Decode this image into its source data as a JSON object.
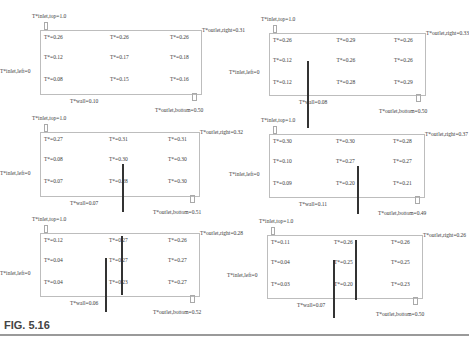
{
  "figure": {
    "caption": "FIG. 5.16"
  },
  "panels": [
    {
      "inlet": "T*inlet,top=1.0",
      "outlet_right": "T*outlet,right=0.31",
      "inlet_left": "T*inlet,left=0",
      "outlet_bottom": "T*outlet,bottom=0.50",
      "wall": "T*wall=0.10",
      "cells": [
        "T*=0.26",
        "T*=0.26",
        "T*=0.26",
        "T*=0.12",
        "T*=0.17",
        "T*=0.18",
        "T*=0.08",
        "T*=0.15",
        "T*=0.16"
      ],
      "partitions": []
    },
    {
      "inlet": "T*inlet,top=1.0",
      "outlet_right": "T*outlet,right=0.33",
      "inlet_left": "T*inlet,left=0",
      "outlet_bottom": "T*outlet,bottom=0.50",
      "wall": "T*wall=0.08",
      "cells": [
        "T*=0.26",
        "T*=0.29",
        "T*=0.26",
        "T*=0.12",
        "T*=0.26",
        "T*=0.26",
        "T*=0.12",
        "T*=0.28",
        "T*=0.29"
      ],
      "partitions": [
        {
          "x": 38,
          "top": 28,
          "bottom": 95
        }
      ]
    },
    {
      "inlet": "T*inlet,top=1.0",
      "outlet_right": "T*outlet,right=0.32",
      "inlet_left": "T*inlet,left=0",
      "outlet_bottom": "T*outlet,bottom=0.51",
      "wall": "T*wall=0.07",
      "cells": [
        "T*=0.27",
        "T*=0.31",
        "T*=0.31",
        "T*=0.08",
        "T*=0.30",
        "T*=0.30",
        "T*=0.07",
        "T*=0.28",
        "T*=0.30"
      ],
      "partitions": [
        {
          "x": 82,
          "top": 32,
          "bottom": 80
        }
      ]
    },
    {
      "inlet": "T*inlet,top=1.0",
      "outlet_right": "T*outlet,right=0.37",
      "inlet_left": "T*inlet,left=0",
      "outlet_bottom": "T*outlet,bottom=0.49",
      "wall": "T*wall=0.11",
      "cells": [
        "T*=0.30",
        "T*=0.30",
        "T*=0.28",
        "T*=0.10",
        "T*=0.27",
        "T*=0.27",
        "T*=0.09",
        "T*=0.20",
        "T*=0.21"
      ],
      "partitions": [
        {
          "x": 88,
          "top": 32,
          "bottom": 80
        }
      ]
    },
    {
      "inlet": "T*inlet,top=1.0",
      "outlet_right": "T*outlet,right=0.28",
      "inlet_left": "T*inlet,left=0",
      "outlet_bottom": "T*outlet,bottom=0.52",
      "wall": "T*wall=0.06",
      "cells": [
        "T*=0.12",
        "T*=0.27",
        "T*=0.26",
        "T*=0.04",
        "T*=0.27",
        "T*=0.27",
        "T*=0.04",
        "T*=0.23",
        "T*=0.27"
      ],
      "partitions": [
        {
          "x": 81,
          "top": 3,
          "bottom": 62
        },
        {
          "x": 65,
          "top": 25,
          "bottom": 79
        }
      ]
    },
    {
      "inlet": "T*inlet,top=1.0",
      "outlet_right": "T*outlet,right=0.26",
      "inlet_left": "T*inlet,left=0",
      "outlet_bottom": "T*outlet,bottom=0.50",
      "wall": "T*wall=0.07",
      "cells": [
        "T*=0.11",
        "T*=0.26",
        "T*=0.26",
        "T*=0.04",
        "T*=0.25",
        "T*=0.25",
        "T*=0.03",
        "T*=0.20",
        "T*=0.23"
      ],
      "partitions": [
        {
          "x": 88,
          "top": 5,
          "bottom": 65
        },
        {
          "x": 66,
          "top": 25,
          "bottom": 83
        }
      ]
    }
  ]
}
